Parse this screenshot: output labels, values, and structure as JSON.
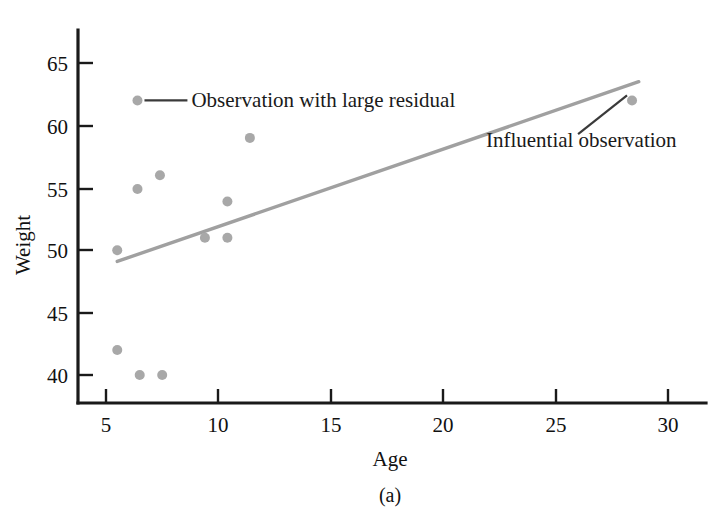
{
  "figure": {
    "caption": "(a)",
    "background_color": "#ffffff"
  },
  "chart_data": {
    "type": "scatter",
    "title": "",
    "xlabel": "Age",
    "ylabel": "Weight",
    "xlim": [
      3.6,
      31.5
    ],
    "ylim": [
      37.0,
      67.4
    ],
    "xticks": [
      5,
      10,
      15,
      20,
      25,
      30
    ],
    "yticks": [
      40,
      45,
      50,
      55,
      60,
      65
    ],
    "xtick_labels": [
      "5",
      "10",
      "15",
      "20",
      "25",
      "30"
    ],
    "ytick_labels": [
      "40",
      "45",
      "50",
      "55",
      "60",
      "65"
    ],
    "grid": false,
    "legend": "none",
    "point_color": "#a8a8a8",
    "line_color": "#a0a0a0",
    "series": [
      {
        "name": "observations",
        "marker_color": "#a8a8a8",
        "points": [
          {
            "x": 6.4,
            "y": 62.0,
            "note": "Observation with large residual"
          },
          {
            "x": 5.5,
            "y": 50.0,
            "note": ""
          },
          {
            "x": 6.4,
            "y": 54.9,
            "note": ""
          },
          {
            "x": 7.4,
            "y": 56.0,
            "note": ""
          },
          {
            "x": 9.4,
            "y": 51.0,
            "note": ""
          },
          {
            "x": 10.4,
            "y": 51.0,
            "note": ""
          },
          {
            "x": 10.4,
            "y": 53.9,
            "note": ""
          },
          {
            "x": 11.4,
            "y": 59.0,
            "note": ""
          },
          {
            "x": 5.5,
            "y": 42.0,
            "note": ""
          },
          {
            "x": 6.5,
            "y": 40.0,
            "note": ""
          },
          {
            "x": 7.5,
            "y": 40.0,
            "note": ""
          },
          {
            "x": 28.4,
            "y": 62.0,
            "note": "Influential observation"
          }
        ]
      }
    ],
    "fit_line": {
      "name": "regression-line",
      "color": "#a0a0a0",
      "x_start": 5.5,
      "y_start": 49.1,
      "x_end": 28.7,
      "y_end": 63.5
    },
    "annotations": [
      {
        "id": "residual-annotation",
        "text": "Observation with large residual",
        "target_x": 6.4,
        "target_y": 62.0,
        "text_x": 8.8,
        "text_y": 62.0
      },
      {
        "id": "influential-annotation",
        "text": "Influential observation",
        "target_x": 28.4,
        "target_y": 62.0,
        "text_x": 21.9,
        "text_y": 58.3
      }
    ]
  }
}
